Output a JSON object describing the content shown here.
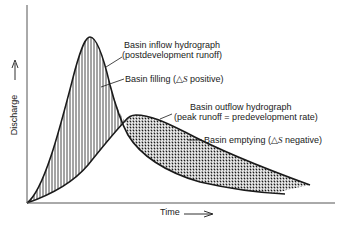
{
  "diagram": {
    "type": "hydrograph",
    "axes": {
      "y_label": "Discharge",
      "y_arrow": "→",
      "x_label": "Time",
      "x_arrow": "——>"
    },
    "annotations": {
      "inflow": {
        "line1": "Basin inflow hydrograph",
        "line2": "(postdevelopment runoff)"
      },
      "filling": {
        "prefix": "Basin filling (",
        "delta": "△",
        "s": "S",
        "suffix": " positive)"
      },
      "outflow": {
        "line1": "Basin outflow hydrograph",
        "line2": "(peak runoff = predevelopment rate)"
      },
      "emptying": {
        "prefix": "Basin emptying (",
        "delta": "△",
        "s": "S",
        "suffix": " negative)"
      }
    },
    "regions": [
      {
        "name": "basin-filling",
        "pattern": "vertical-hatch"
      },
      {
        "name": "basin-emptying",
        "pattern": "crosshatch"
      }
    ],
    "colors": {
      "line": "#1a1a1a",
      "background": "#ffffff"
    }
  }
}
